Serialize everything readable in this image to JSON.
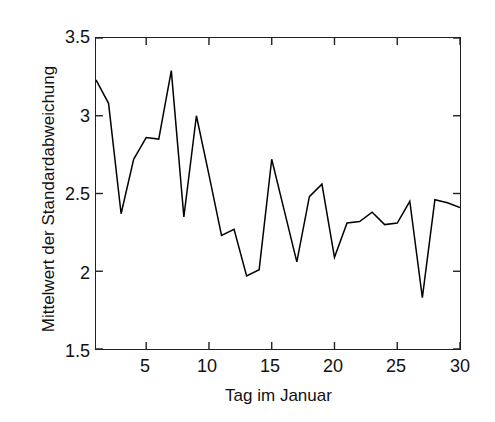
{
  "chart_data": {
    "type": "line",
    "title": "",
    "subtitle": "",
    "xlabel": "Tag im Januar",
    "ylabel": "Mittelwert der Standardabweichung",
    "xlim": [
      1,
      30
    ],
    "ylim": [
      1.5,
      3.5
    ],
    "xticks": [
      5,
      10,
      15,
      20,
      25,
      30
    ],
    "xtick_labels": [
      "5",
      "10",
      "15",
      "20",
      "25",
      "30"
    ],
    "yticks": [
      1.5,
      2,
      2.5,
      3,
      3.5
    ],
    "ytick_labels": [
      "1.5",
      "2",
      "2.5",
      "3",
      "3.5"
    ],
    "grid": false,
    "legend": null,
    "legend_position": "none",
    "line_color": "#000000",
    "background_color": "#ffffff",
    "axis_color": "#202020",
    "x": [
      1,
      2,
      3,
      4,
      5,
      6,
      7,
      8,
      9,
      10,
      11,
      12,
      13,
      14,
      15,
      16,
      17,
      18,
      19,
      20,
      21,
      22,
      23,
      24,
      25,
      26,
      27,
      28,
      29,
      30
    ],
    "series": [
      {
        "name": "Mittelwert der Standardabweichung",
        "values": [
          3.23,
          3.08,
          2.37,
          2.72,
          2.86,
          2.85,
          3.29,
          2.35,
          3.0,
          2.62,
          2.23,
          2.27,
          1.97,
          2.01,
          2.72,
          2.39,
          2.06,
          2.48,
          2.56,
          2.09,
          2.31,
          2.32,
          2.38,
          2.3,
          2.31,
          2.45,
          1.83,
          2.46,
          2.44,
          2.41
        ]
      }
    ]
  },
  "axis": {
    "ylabel_text": "Mittelwert der Standardabweichung",
    "xlabel_text": "Tag im Januar"
  }
}
